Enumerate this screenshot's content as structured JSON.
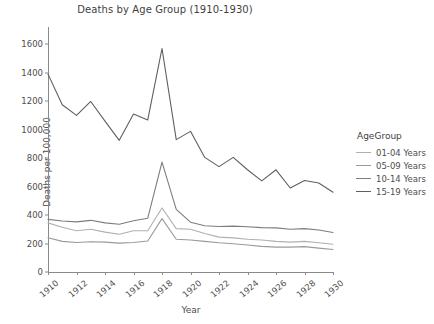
{
  "chart_data": {
    "type": "line",
    "title": "Deaths by Age Group (1910-1930)",
    "xlabel": "Year",
    "ylabel": "Deaths per 100,000",
    "legend_title": "AgeGroup",
    "legend_position": "right",
    "grid": false,
    "xlim": [
      1910,
      1930
    ],
    "ylim": [
      0,
      1700
    ],
    "xticks": [
      1910,
      1912,
      1914,
      1916,
      1918,
      1920,
      1922,
      1924,
      1926,
      1928,
      1930
    ],
    "xtick_labels": [
      "1910",
      "1912",
      "1914",
      "1916",
      "1918",
      "1920",
      "1922",
      "1924",
      "1926",
      "1928",
      "1930"
    ],
    "yticks": [
      0,
      200,
      400,
      600,
      800,
      1000,
      1200,
      1400,
      1600
    ],
    "ytick_labels": [
      "0",
      "200",
      "400",
      "600",
      "800",
      "1000",
      "1200",
      "1400",
      "1600"
    ],
    "x": [
      1910,
      1911,
      1912,
      1913,
      1914,
      1915,
      1916,
      1917,
      1918,
      1919,
      1920,
      1921,
      1922,
      1923,
      1924,
      1925,
      1926,
      1927,
      1928,
      1929,
      1930
    ],
    "series": [
      {
        "name": "01-04 Years",
        "color": "#b0b0b0",
        "values": [
          345,
          315,
          290,
          300,
          280,
          265,
          290,
          290,
          450,
          305,
          300,
          270,
          245,
          240,
          230,
          225,
          215,
          210,
          215,
          205,
          195
        ]
      },
      {
        "name": "05-09 Years",
        "color": "#9a9a9a",
        "values": [
          240,
          215,
          207,
          212,
          210,
          203,
          207,
          218,
          375,
          230,
          225,
          215,
          205,
          198,
          190,
          180,
          175,
          175,
          178,
          168,
          158
        ]
      },
      {
        "name": "10-14 Years",
        "color": "#7d7d7d",
        "values": [
          370,
          358,
          352,
          363,
          345,
          335,
          360,
          378,
          772,
          440,
          350,
          325,
          320,
          322,
          318,
          312,
          310,
          300,
          305,
          295,
          277
        ]
      },
      {
        "name": "15-19 Years",
        "color": "#5f5f5f",
        "values": [
          1390,
          1175,
          1100,
          1198,
          1060,
          925,
          1110,
          1068,
          1570,
          930,
          988,
          805,
          740,
          805,
          718,
          640,
          718,
          590,
          643,
          625,
          560
        ]
      }
    ]
  },
  "legend": {
    "title": "AgeGroup",
    "entries": [
      "01-04 Years",
      "05-09 Years",
      "10-14 Years",
      "15-19 Years"
    ]
  }
}
